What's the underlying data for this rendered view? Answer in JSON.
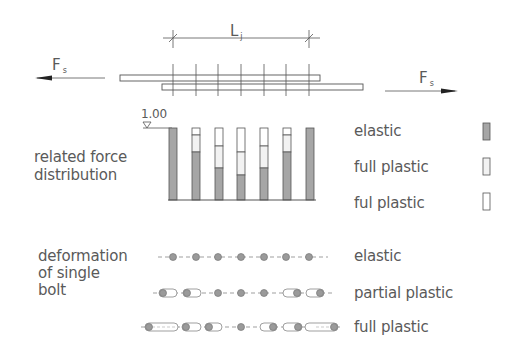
{
  "diagram": {
    "title_symbol_length": "L",
    "title_symbol_length_sub": "j",
    "force_left": "F",
    "force_left_sub": "s",
    "force_right": "F",
    "force_right_sub": "s",
    "scale_label": "1.00",
    "section_force": {
      "label_line1": "related force",
      "label_line2": "distribution",
      "bars": [
        {
          "white": 0.0,
          "light": 0.0,
          "gray": 1.0
        },
        {
          "white": 0.1,
          "light": 0.24,
          "gray": 0.66
        },
        {
          "white": 0.25,
          "light": 0.31,
          "gray": 0.44
        },
        {
          "white": 0.33,
          "light": 0.32,
          "gray": 0.35
        },
        {
          "white": 0.25,
          "light": 0.31,
          "gray": 0.44
        },
        {
          "white": 0.1,
          "light": 0.24,
          "gray": 0.66
        },
        {
          "white": 0.0,
          "light": 0.0,
          "gray": 1.0
        }
      ]
    },
    "legend": [
      {
        "label": "elastic",
        "swatch": "dark-gray"
      },
      {
        "label": "full plastic",
        "swatch": "light"
      },
      {
        "label": "ful plastic",
        "swatch": "white"
      }
    ],
    "section_bolt": {
      "label_line1": "deformation",
      "label_line2": "of single",
      "label_line3": "bolt",
      "rows": [
        {
          "label": "elastic",
          "elongations": [
            0,
            0,
            0,
            0,
            0,
            0,
            0
          ]
        },
        {
          "label": "partial plastic",
          "elongations": [
            -12,
            -12,
            0,
            0,
            0,
            12,
            12
          ]
        },
        {
          "label": "full plastic",
          "elongations": [
            -28,
            -12,
            -10,
            0,
            10,
            12,
            28
          ]
        }
      ]
    },
    "colors": {
      "line": "#555555",
      "gray_fill": "#a6a6a6",
      "light_fill": "#f2f2f2",
      "bolt_fill": "#9a9a9a"
    }
  }
}
